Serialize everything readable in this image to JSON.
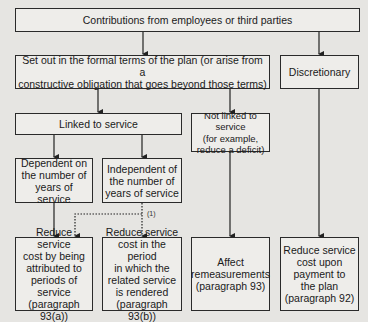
{
  "diagram": {
    "nodes": {
      "contributions": "Contributions from employees or third parties",
      "formal_terms": "Set out in the formal terms of the plan (or arise from a\nconstructive obligation that goes beyond those terms)",
      "discretionary": "Discretionary",
      "linked": "Linked to service",
      "not_linked": "Not linked to service\n(for example,\nreduce a deficit)",
      "dependent": "Dependent on\nthe number of\nyears of service",
      "independent": "Independent of\nthe number of\nyears of service",
      "outcome_93a": "Reduce service\ncost by being\nattributed to\nperiods of service\n(paragraph 93(a))",
      "outcome_93b": "Reduce service\ncost in the period\nin which the\nrelated service\nis rendered\n(paragraph 93(b))",
      "outcome_93": "Affect\nremeasurements\n(paragraph 93)",
      "outcome_92": "Reduce service\ncost upon\npayment to\nthe plan\n(paragraph 92)"
    },
    "note_label": "(1)",
    "colors": {
      "background": "#e6e5e2",
      "line": "#2a2a2a"
    }
  }
}
